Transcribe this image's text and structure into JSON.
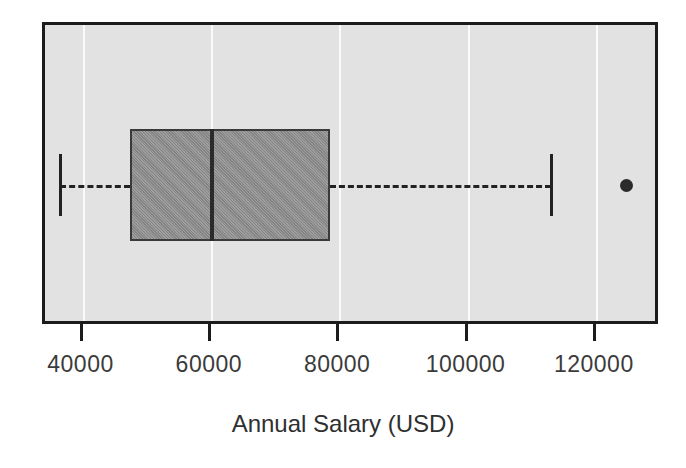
{
  "chart_data": {
    "type": "box",
    "orientation": "horizontal",
    "title": "",
    "xlabel": "Annual Salary (USD)",
    "ylabel": "",
    "xlim": [
      34000,
      130000
    ],
    "grid": true,
    "legend": null,
    "xticks": [
      {
        "value": 40000,
        "label": "40000"
      },
      {
        "value": 60000,
        "label": "60000"
      },
      {
        "value": 80000,
        "label": "80000"
      },
      {
        "value": 100000,
        "label": "100000"
      },
      {
        "value": 120000,
        "label": "120000"
      }
    ],
    "boxes": [
      {
        "name": "Annual Salary",
        "whisker_low": 36400,
        "q1": 47200,
        "median": 60000,
        "q3": 78400,
        "whisker_high": 112900,
        "outliers": [
          124700
        ]
      }
    ],
    "style": {
      "box_fill": "#8c8c8c",
      "box_edge": "#3a3a3a",
      "median_color": "#2b2b2b",
      "whisker_color": "#222222",
      "whisker_style": "dashed",
      "outlier_marker": "filled-circle",
      "outlier_color": "#2b2b2b",
      "plot_background": "#e2e2e2",
      "figure_background": "#ffffff",
      "grid_color": "#fbfbfb",
      "frame_color": "#1c1c1c"
    }
  },
  "axis": {
    "label": "Annual Salary (USD)"
  }
}
